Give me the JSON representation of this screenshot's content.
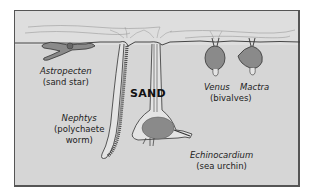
{
  "diagram": {
    "substrate_label": "SAND",
    "colors": {
      "frame_border": "#555555",
      "sand": "#d6d6d6",
      "water": "#dedede",
      "line": "#333333",
      "animal_fill": "#8a8a8a",
      "background": "#ffffff"
    },
    "organisms": [
      {
        "id": "astropecten",
        "genus": "Astropecten",
        "common": "(sand star)"
      },
      {
        "id": "nephtys",
        "genus": "Nephtys",
        "common_line1": "(polychaete",
        "common_line2": "worm)"
      },
      {
        "id": "echinocardium",
        "genus": "Echinocardium",
        "common": "(sea urchin)"
      },
      {
        "id": "venus",
        "genus": "Venus"
      },
      {
        "id": "mactra",
        "genus": "Mactra"
      }
    ],
    "group_labels": {
      "bivalves": "(bivalves)"
    }
  }
}
